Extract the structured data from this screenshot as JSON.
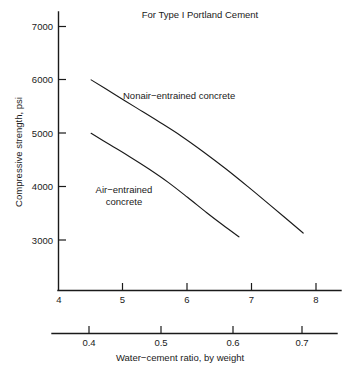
{
  "chart_data": {
    "type": "line",
    "title": "For Type I Portland Cement",
    "xlabel": "",
    "ylabel": "Compressive strength, psi",
    "secondary_xlabel": "Water−cement ratio, by weight",
    "grid": false,
    "legend_position": "inline-annotation",
    "xlim": [
      4,
      8.45
    ],
    "ylim": [
      2550,
      7250
    ],
    "xticks": [
      4,
      5,
      6,
      7,
      8
    ],
    "xtick_labels": [
      "4",
      "5",
      "6",
      "7",
      "8"
    ],
    "yticks": [
      3000,
      4000,
      5000,
      6000,
      7000
    ],
    "ytick_labels": [
      "3000",
      "4000",
      "5000",
      "6000",
      "7000"
    ],
    "secondary_axis": {
      "name": "water-cement-ratio-axis",
      "lim": [
        3.9,
        8.45
      ],
      "ticks": [
        4.48,
        5.6,
        6.72,
        7.8
      ],
      "tick_labels": [
        "0.4",
        "0.5",
        "0.6",
        "0.7"
      ],
      "label": "Water−cement ratio, by weight"
    },
    "series": [
      {
        "name": "Nonair−entrained concrete",
        "label": "Nonair−entrained concrete",
        "label_lines": [
          "Nonair−entrained concrete"
        ],
        "color": "#1a1a1a",
        "x": [
          4.5,
          4.85,
          5.2,
          5.55,
          5.9,
          6.25,
          6.6,
          6.95,
          7.3,
          7.8
        ],
        "y": [
          6000,
          5740,
          5480,
          5220,
          4950,
          4650,
          4330,
          3990,
          3640,
          3130
        ]
      },
      {
        "name": "Air−entrained concrete",
        "label": "Air−entrained concrete",
        "label_lines": [
          "Air−entrained",
          "concrete"
        ],
        "color": "#1a1a1a",
        "x": [
          4.5,
          4.8,
          5.1,
          5.4,
          5.7,
          6.0,
          6.3,
          6.55,
          6.8
        ],
        "y": [
          5000,
          4780,
          4560,
          4330,
          4080,
          3800,
          3510,
          3280,
          3060
        ]
      }
    ],
    "annotations": [
      {
        "name": "nonair-curve-label",
        "text": "Nonair−entrained concrete",
        "lines": [
          "Nonair−entrained concrete"
        ],
        "x_px": 123,
        "y_px": 99,
        "align": "left"
      },
      {
        "name": "air-curve-label",
        "text": "Air−entrained concrete",
        "lines": [
          "Air−entrained",
          "concrete"
        ],
        "x_px": 86,
        "y_px": 193,
        "align": "left"
      }
    ],
    "colors": {
      "ink": "#1a1a1a",
      "background": "#ffffff"
    }
  },
  "figure": {
    "title": "For Type I Portland Cement",
    "y_axis_title": "Compressive strength, psi",
    "secondary_x_axis_title": "Water−cement ratio, by weight"
  }
}
